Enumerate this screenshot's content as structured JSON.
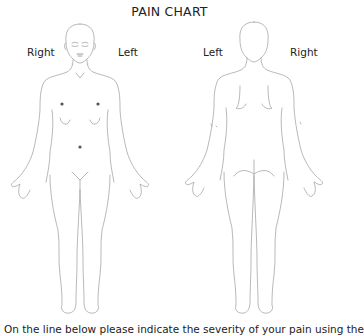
{
  "document": {
    "title": "PAIN CHART",
    "front_figure": {
      "label_right": "Right",
      "label_left": "Left",
      "marked_points": [
        {
          "name": "right-chest",
          "x": 62,
          "y": 103
        },
        {
          "name": "left-chest",
          "x": 98,
          "y": 103
        },
        {
          "name": "abdomen",
          "x": 80,
          "y": 146
        }
      ]
    },
    "back_figure": {
      "label_left": "Left",
      "label_right": "Right"
    },
    "instructions": "On the line below please indicate the severity of your pain using the",
    "colors": {
      "outline": "#9a9a9a",
      "marker": "#555555",
      "text": "#222222",
      "background": "#ffffff"
    }
  }
}
